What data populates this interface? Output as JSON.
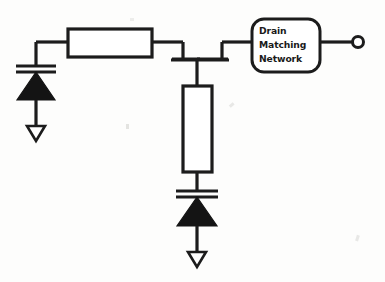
{
  "diagram": {
    "background_color": "#fdfdfc",
    "ink_color": "#1c1c1c",
    "blocks": [
      {
        "id": "drain-matching-network",
        "shape": "rounded-rectangle",
        "label_lines": [
          "Drain",
          "Matching",
          "Network"
        ]
      },
      {
        "id": "series-transmission-line",
        "shape": "rectangle",
        "label_lines": []
      },
      {
        "id": "shunt-transmission-line",
        "shape": "rectangle",
        "label_lines": []
      }
    ],
    "components": [
      {
        "id": "left-capacitor",
        "type": "capacitor",
        "orientation": "horizontal-plates"
      },
      {
        "id": "left-diode",
        "type": "diode",
        "direction": "up",
        "fill": "solid"
      },
      {
        "id": "left-ground",
        "type": "ground-arrow",
        "fill": "hollow"
      },
      {
        "id": "shunt-capacitor",
        "type": "capacitor",
        "orientation": "horizontal-plates"
      },
      {
        "id": "shunt-diode",
        "type": "diode",
        "direction": "up",
        "fill": "solid"
      },
      {
        "id": "shunt-ground",
        "type": "ground-arrow",
        "fill": "hollow"
      },
      {
        "id": "device-junction",
        "type": "transistor-node"
      },
      {
        "id": "output-terminal",
        "type": "open-circle-terminal"
      }
    ],
    "text": {
      "dmn_line1": "Drain",
      "dmn_line2": "Matching",
      "dmn_line3": "Network"
    }
  }
}
